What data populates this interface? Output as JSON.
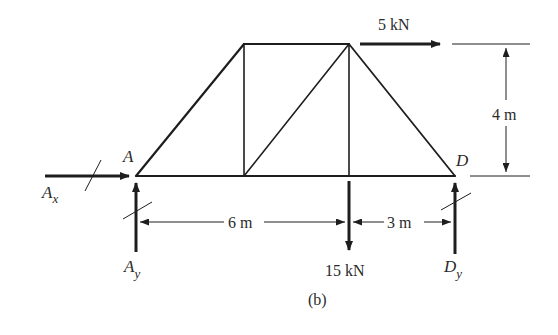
{
  "figure": {
    "caption": "(b)",
    "type": "truss free-body diagram"
  },
  "joints": {
    "A": {
      "label": "A",
      "x": 136,
      "y": 176
    },
    "D": {
      "label": "D",
      "x": 455,
      "y": 176
    },
    "top_left": {
      "x": 244,
      "y": 44
    },
    "top_right": {
      "x": 349,
      "y": 44
    },
    "bottom_mid": {
      "x": 244,
      "y": 176
    },
    "bottom_load": {
      "x": 349,
      "y": 176
    }
  },
  "loads": {
    "horizontal": {
      "label": "5 kN",
      "direction": "right"
    },
    "vertical": {
      "label": "15 kN",
      "direction": "down"
    }
  },
  "reactions": {
    "Ax": {
      "label": "A",
      "sub": "x",
      "direction": "right"
    },
    "Ay": {
      "label": "A",
      "sub": "y",
      "direction": "up"
    },
    "Dy": {
      "label": "D",
      "sub": "y",
      "direction": "up"
    }
  },
  "dimensions": {
    "height": "4 m",
    "span_left": "6 m",
    "span_right": "3 m"
  },
  "colors": {
    "ink": "#1e1e1e",
    "background": "#ffffff"
  }
}
